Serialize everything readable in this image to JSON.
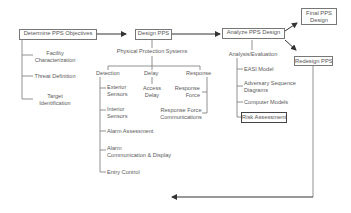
{
  "diagram": {
    "steps": {
      "determine": "Determine PPS Objectives",
      "design": "Design PPS",
      "analyze": "Analyze PPS Design",
      "final": [
        "Final PPS",
        "Design"
      ],
      "redesign": "Redesign PPS"
    },
    "objectives": [
      [
        "Facility",
        "Characterization"
      ],
      [
        "Threat Definition"
      ],
      [
        "Target",
        "Identification"
      ]
    ],
    "pps_label": "Physical Protection Systems",
    "categories": {
      "detection": "Detection",
      "delay": "Delay",
      "response": "Response"
    },
    "detection_items": [
      [
        "Exterior",
        "Sensors"
      ],
      [
        "Interior",
        "Sensors"
      ],
      [
        "Alarm Assessment"
      ],
      [
        "Alarm",
        "Communication & Display"
      ],
      [
        "Entry Control"
      ]
    ],
    "delay_items": [
      [
        "Access",
        "Delay"
      ]
    ],
    "response_items": [
      [
        "Response",
        "Force"
      ],
      [
        "Response Force",
        "Communications"
      ]
    ],
    "analysis_label": "Analysis/Evaluation",
    "analysis_items": [
      [
        "EASI Model"
      ],
      [
        "Adversary Sequence",
        "Diagrams"
      ],
      [
        "Computer Models"
      ],
      [
        "Risk Assessment"
      ]
    ]
  }
}
